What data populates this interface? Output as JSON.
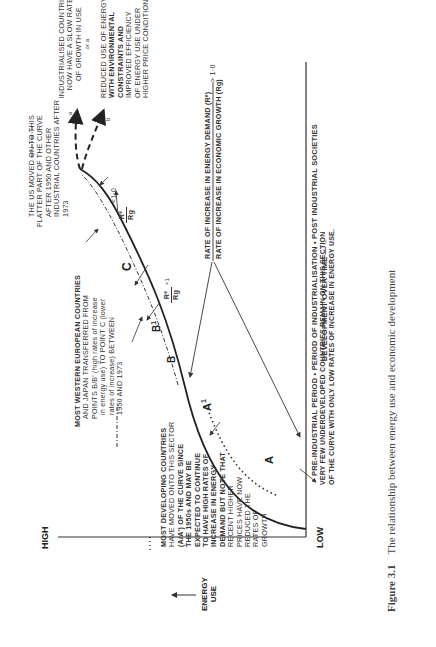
{
  "figure": {
    "number": "Figure 3.1",
    "caption": "The relationship between energy use and economic development"
  },
  "axes": {
    "y_label_line1": "ENERGY",
    "y_label_line2": "USE",
    "y_high": "HIGH",
    "y_low": "LOW",
    "x_label_line1": "PRE-INDUSTRIAL PERIOD • PERIOD OF INDUSTRIALISATION • POST INDUSTRIAL SOCIETIES",
    "x_label_line2": "DEVELOPMENT OVER TIME —→"
  },
  "points": {
    "a": "A",
    "a_prime": "A",
    "b": "B",
    "b_prime": "B",
    "c": "C",
    "prime": "1"
  },
  "ratios": {
    "top_num": "RATE OF INCREASE IN ENERGY DEMAND (Rᵉ)",
    "top_den": "RATE OF INCREASE IN ECONOMIC GROWTH (Rg)",
    "top_rel": "> 1·0",
    "mid_num": "Rᵉ",
    "mid_den": "Rg",
    "mid_rel": "≈1",
    "upper_num": "Rᵉ",
    "upper_den": "Rg",
    "upper_rel": "<1·0"
  },
  "annotations": {
    "industrialised": [
      "INDUSTRIALISED COUNTRIES",
      "NOW HAVE A SLOW RATE",
      "OF GROWTH IN USE"
    ],
    "or_a": "or a",
    "reduced": [
      "REDUCED USE OF ENERGY",
      "WITH ENVIRONMENTAL",
      "CONSTRAINTS AND",
      "IMPROVED EFFICIENCY",
      "OF ENERGY USE UNDER",
      "HIGHER PRICE CONDITIONS"
    ],
    "arrow_a": "a",
    "arrow_b": "b",
    "us": [
      "THE US MOVED ON TO THIS",
      "FLATTER PART OF THE CURVE",
      "AFTER 1950  AND OTHER",
      "INDUSTRIAL  COUNTRIES AFTER",
      "1973"
    ],
    "western": [
      "MOST WESTERN EUROPEAN COUNTRIES",
      "AND  JAPAN TRANSFERRED FROM",
      "POINTS B/B' (high rates of increase",
      "in energy use) TO POINT C (lower",
      "rates of increase) BETWEEN",
      "1950  AND 1973"
    ],
    "developing": [
      "MOST DEVELOPING COUNTRIES",
      "HAVE MOVED ONTO THIS SECTOR",
      "(A/A') OF THE CURVE SINCE",
      "THE 1950s AND MAY BE",
      "EXPECTED TO CONTINUE",
      "TO HAVE HIGH RATES OF",
      "INCREASE IN ENERGY",
      "DEMAND BUT NOTE THAT",
      "RECENT  HIGHER",
      "PRICES HAVE NOW",
      "REDUCED THE",
      "RATES OF",
      "GROWTH"
    ],
    "underdeveloped": [
      "VERY FEW UNDERDEVELOPED COUNTRIES REMAIN ON THIS SECTION",
      "OF THE CURVE WITH ONLY LOW RATES OF INCREASE IN ENERGY USE."
    ]
  }
}
